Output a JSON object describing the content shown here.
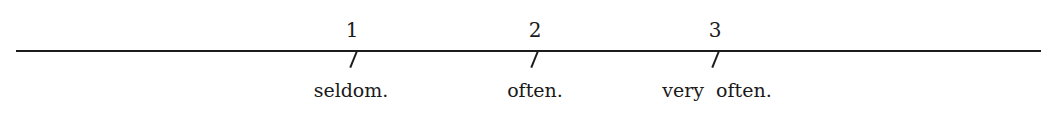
{
  "scale": {
    "points": [
      {
        "number": "1",
        "label": "seldom.",
        "x": 356
      },
      {
        "number": "2",
        "label": "often.",
        "x": 535
      },
      {
        "number": "3",
        "label": "very  often.",
        "x": 715
      }
    ]
  }
}
